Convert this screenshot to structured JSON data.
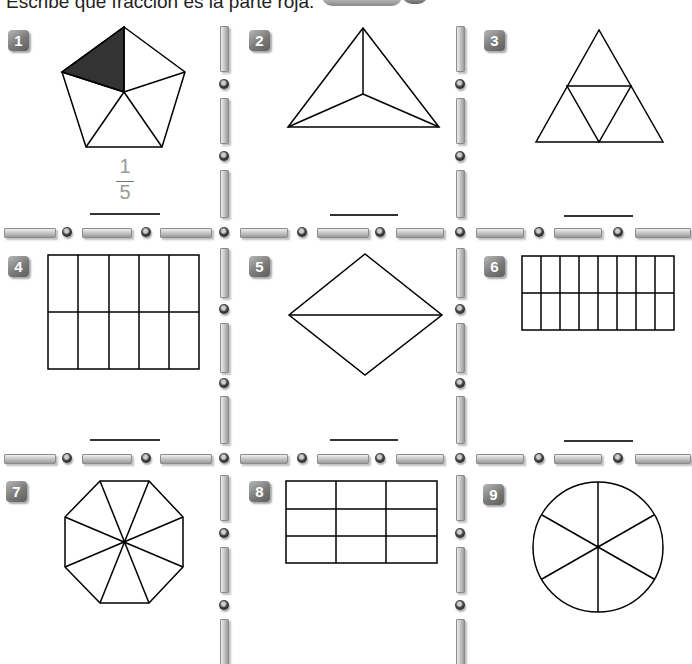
{
  "instruction": "Escribe qué fracción es la parte roja.",
  "colors": {
    "shaded": "#333333",
    "stroke": "#000000",
    "badge": "#7a7a7a",
    "trace_text": "#9a9a9a"
  },
  "exercises": [
    {
      "number": "1",
      "shape": "pentagon",
      "parts": 5,
      "shaded_parts": 1,
      "answer": {
        "numerator": "1",
        "denominator": "5"
      }
    },
    {
      "number": "2",
      "shape": "triangle-3-parts",
      "parts": 3,
      "shaded_parts": 0,
      "answer": ""
    },
    {
      "number": "3",
      "shape": "triangle-4-parts",
      "parts": 4,
      "shaded_parts": 0,
      "answer": ""
    },
    {
      "number": "4",
      "shape": "rectangle-grid-5x2",
      "parts": 10,
      "shaded_parts": 0,
      "answer": ""
    },
    {
      "number": "5",
      "shape": "rhombus-2-parts",
      "parts": 2,
      "shaded_parts": 0,
      "answer": ""
    },
    {
      "number": "6",
      "shape": "rectangle-grid-8x2",
      "parts": 16,
      "shaded_parts": 0,
      "answer": ""
    },
    {
      "number": "7",
      "shape": "octagon-8-parts",
      "parts": 8,
      "shaded_parts": 0,
      "answer": ""
    },
    {
      "number": "8",
      "shape": "rectangle-grid-3x3",
      "parts": 9,
      "shaded_parts": 0,
      "answer": ""
    },
    {
      "number": "9",
      "shape": "circle-6-parts",
      "parts": 6,
      "shaded_parts": 0,
      "answer": ""
    }
  ]
}
